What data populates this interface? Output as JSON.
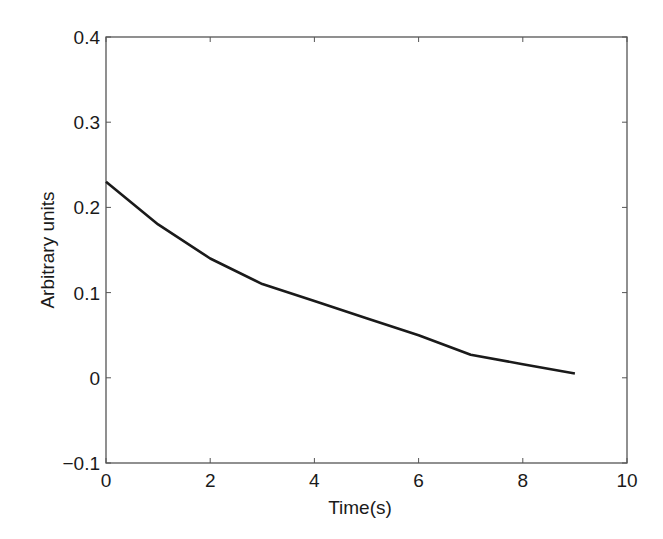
{
  "chart_data": {
    "type": "line",
    "title": "",
    "xlabel": "Time(s)",
    "ylabel": "Arbitrary units",
    "xlim": [
      0,
      10
    ],
    "ylim": [
      -0.1,
      0.4
    ],
    "xticks": [
      0,
      2,
      4,
      6,
      8,
      10
    ],
    "yticks": [
      -0.1,
      0,
      0.1,
      0.2,
      0.3,
      0.4
    ],
    "xtick_labels": [
      "0",
      "2",
      "4",
      "6",
      "8",
      "10"
    ],
    "ytick_labels": [
      "−0.1",
      "0",
      "0.1",
      "0.2",
      "0.3",
      "0.4"
    ],
    "grid": false,
    "legend": null,
    "series": [
      {
        "name": "signal",
        "color": "#1a1a1a",
        "x": [
          0,
          1,
          2,
          3,
          4,
          5,
          6,
          7,
          8,
          9
        ],
        "y": [
          0.23,
          0.18,
          0.14,
          0.11,
          0.09,
          0.07,
          0.05,
          0.027,
          0.016,
          0.005
        ]
      }
    ]
  },
  "colors": {
    "axis": "#555555",
    "line": "#1a1a1a",
    "background": "#ffffff"
  }
}
